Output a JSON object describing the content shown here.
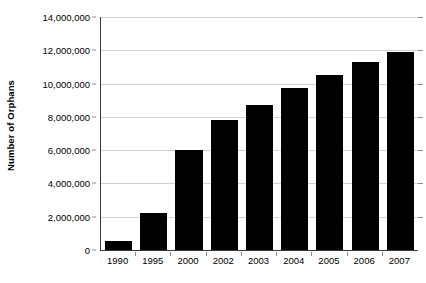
{
  "chart_data": {
    "type": "bar",
    "title": "",
    "subtitle": "",
    "xlabel": "",
    "ylabel": "Number of Orphans",
    "categories": [
      "1990",
      "1995",
      "2000",
      "2002",
      "2003",
      "2004",
      "2005",
      "2006",
      "2007"
    ],
    "values": [
      550000,
      2200000,
      6000000,
      7800000,
      8700000,
      9750000,
      10500000,
      11300000,
      11900000
    ],
    "series": [
      {
        "name": "Number of Orphans",
        "values": [
          550000,
          2200000,
          6000000,
          7800000,
          8700000,
          9750000,
          10500000,
          11300000,
          11900000
        ]
      }
    ],
    "ylim": [
      0,
      14000000
    ],
    "ytick_values": [
      0,
      2000000,
      4000000,
      6000000,
      8000000,
      10000000,
      12000000,
      14000000
    ],
    "ytick_labels": [
      "0",
      "2,000,000",
      "4,000,000",
      "6,000,000",
      "8,000,000",
      "10,000,000",
      "12,000,000",
      "14,000,000"
    ],
    "grid": true,
    "legend": false,
    "legend_position": "none",
    "bar_color": "#000000",
    "gridline_color": "#d2d2d2",
    "axis_color": "#3a3a3a",
    "background_color": "#ffffff"
  }
}
